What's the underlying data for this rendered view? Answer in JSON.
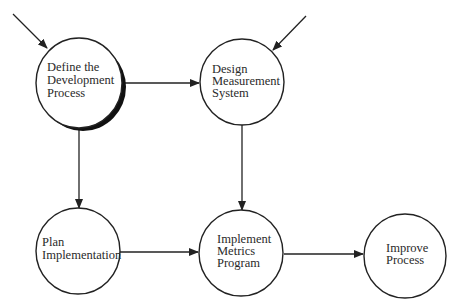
{
  "diagram": {
    "type": "process-flow",
    "nodes": [
      {
        "id": "define",
        "lines": [
          "Define the",
          "Development",
          "Process"
        ],
        "shadow": true
      },
      {
        "id": "design",
        "lines": [
          "Design",
          "Measurement",
          "System"
        ],
        "shadow": false
      },
      {
        "id": "plan",
        "lines": [
          "Plan",
          "Implementation"
        ],
        "shadow": false
      },
      {
        "id": "implement",
        "lines": [
          "Implement",
          "Metrics",
          "Program"
        ],
        "shadow": false
      },
      {
        "id": "improve",
        "lines": [
          "Improve",
          "Process"
        ],
        "shadow": false
      }
    ],
    "edges": [
      {
        "from": "external",
        "to": "define"
      },
      {
        "from": "external",
        "to": "design"
      },
      {
        "from": "define",
        "to": "design"
      },
      {
        "from": "define",
        "to": "plan"
      },
      {
        "from": "design",
        "to": "implement"
      },
      {
        "from": "plan",
        "to": "implement"
      },
      {
        "from": "implement",
        "to": "improve"
      }
    ],
    "colors": {
      "stroke": "#222222",
      "fill": "#ffffff",
      "shadow": "#111111"
    }
  }
}
